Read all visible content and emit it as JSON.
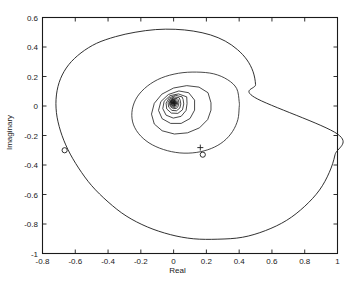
{
  "figure": {
    "xlabel": "Real",
    "ylabel": "Imaginary",
    "title": "",
    "line_color": "#1a1a1a",
    "axis_color": "#1a1a1a",
    "background": "#ffffff"
  },
  "axes": {
    "x_ticks": [
      "-0.8",
      "-0.6",
      "-0.4",
      "-0.2",
      "0",
      "0.2",
      "0.4",
      "0.6",
      "0.8",
      "1"
    ],
    "y_ticks": [
      "0.6",
      "0.4",
      "0.2",
      "0",
      "-0.2",
      "-0.4",
      "-0.6",
      "-0.8",
      "-1"
    ]
  },
  "chart_data": {
    "type": "line",
    "title": "",
    "xlabel": "Real",
    "ylabel": "Imaginary",
    "xlim": [
      -0.8,
      1.0
    ],
    "ylim": [
      -1.0,
      0.6
    ],
    "x_ticks": [
      -0.8,
      -0.6,
      -0.4,
      -0.2,
      0,
      0.2,
      0.4,
      0.6,
      0.8,
      1.0
    ],
    "y_ticks": [
      0.6,
      0.4,
      0.2,
      0,
      -0.2,
      -0.4,
      -0.6,
      -0.8,
      -1.0
    ],
    "grid": false,
    "legend": false,
    "series": [
      {
        "name": "outer-loop",
        "kind": "closed-polygon",
        "points": [
          [
            1.0,
            -0.19
          ],
          [
            0.985,
            -0.33
          ],
          [
            0.95,
            -0.45
          ],
          [
            0.89,
            -0.57
          ],
          [
            0.8,
            -0.68
          ],
          [
            0.69,
            -0.775
          ],
          [
            0.56,
            -0.845
          ],
          [
            0.42,
            -0.89
          ],
          [
            0.27,
            -0.903
          ],
          [
            0.12,
            -0.9
          ],
          [
            -0.02,
            -0.872
          ],
          [
            -0.16,
            -0.82
          ],
          [
            -0.29,
            -0.745
          ],
          [
            -0.4,
            -0.65
          ],
          [
            -0.5,
            -0.54
          ],
          [
            -0.58,
            -0.42
          ],
          [
            -0.645,
            -0.295
          ],
          [
            -0.69,
            -0.17
          ],
          [
            -0.715,
            -0.045
          ],
          [
            -0.715,
            0.075
          ],
          [
            -0.69,
            0.185
          ],
          [
            -0.64,
            0.28
          ],
          [
            -0.565,
            0.36
          ],
          [
            -0.47,
            0.425
          ],
          [
            -0.355,
            0.47
          ],
          [
            -0.235,
            0.5
          ],
          [
            -0.11,
            0.518
          ],
          [
            0.01,
            0.52
          ],
          [
            0.12,
            0.508
          ],
          [
            0.225,
            0.482
          ],
          [
            0.315,
            0.44
          ],
          [
            0.39,
            0.382
          ],
          [
            0.448,
            0.312
          ],
          [
            0.485,
            0.232
          ],
          [
            0.5,
            0.145
          ],
          [
            0.495,
            0.058
          ]
        ]
      },
      {
        "name": "ring-2",
        "kind": "closed-polygon",
        "points": [
          [
            0.4,
            0.03
          ],
          [
            0.385,
            0.118
          ],
          [
            0.33,
            0.178
          ],
          [
            0.245,
            0.218
          ],
          [
            0.14,
            0.23
          ],
          [
            0.03,
            0.222
          ],
          [
            -0.075,
            0.19
          ],
          [
            -0.16,
            0.135
          ],
          [
            -0.222,
            0.062
          ],
          [
            -0.252,
            -0.022
          ],
          [
            -0.25,
            -0.108
          ],
          [
            -0.215,
            -0.185
          ],
          [
            -0.15,
            -0.25
          ],
          [
            -0.062,
            -0.295
          ],
          [
            0.038,
            -0.318
          ],
          [
            0.138,
            -0.315
          ],
          [
            0.23,
            -0.288
          ],
          [
            0.305,
            -0.24
          ],
          [
            0.36,
            -0.172
          ],
          [
            0.392,
            -0.092
          ],
          [
            0.4,
            -0.01
          ]
        ]
      },
      {
        "name": "ring-3",
        "kind": "closed-polygon",
        "points": [
          [
            0.228,
            0.022
          ],
          [
            0.21,
            0.09
          ],
          [
            0.155,
            0.128
          ],
          [
            0.08,
            0.138
          ],
          [
            0.0,
            0.122
          ],
          [
            -0.072,
            0.08
          ],
          [
            -0.118,
            0.018
          ],
          [
            -0.135,
            -0.055
          ],
          [
            -0.118,
            -0.122
          ],
          [
            -0.07,
            -0.168
          ],
          [
            0.005,
            -0.19
          ],
          [
            0.085,
            -0.182
          ],
          [
            0.158,
            -0.148
          ],
          [
            0.208,
            -0.092
          ],
          [
            0.228,
            -0.028
          ]
        ]
      },
      {
        "name": "ring-4",
        "kind": "closed-polygon",
        "points": [
          [
            0.128,
            0.04
          ],
          [
            0.092,
            0.09
          ],
          [
            0.032,
            0.102
          ],
          [
            -0.032,
            0.078
          ],
          [
            -0.078,
            0.03
          ],
          [
            -0.092,
            -0.03
          ],
          [
            -0.07,
            -0.086
          ],
          [
            -0.018,
            -0.118
          ],
          [
            0.046,
            -0.118
          ],
          [
            0.1,
            -0.085
          ],
          [
            0.128,
            -0.028
          ]
        ]
      },
      {
        "name": "ring-5",
        "kind": "closed-polygon",
        "points": [
          [
            0.08,
            0.062
          ],
          [
            0.03,
            0.082
          ],
          [
            -0.022,
            0.07
          ],
          [
            -0.058,
            0.032
          ],
          [
            -0.066,
            -0.018
          ],
          [
            -0.046,
            -0.062
          ],
          [
            -0.002,
            -0.082
          ],
          [
            0.046,
            -0.07
          ],
          [
            0.076,
            -0.03
          ],
          [
            0.082,
            0.016
          ]
        ]
      },
      {
        "name": "ring-6",
        "kind": "closed-polygon",
        "points": [
          [
            0.052,
            0.062
          ],
          [
            0.012,
            0.072
          ],
          [
            -0.026,
            0.056
          ],
          [
            -0.046,
            0.02
          ],
          [
            -0.042,
            -0.02
          ],
          [
            -0.014,
            -0.048
          ],
          [
            0.026,
            -0.05
          ],
          [
            0.054,
            -0.026
          ],
          [
            0.062,
            0.014
          ],
          [
            0.058,
            0.044
          ]
        ]
      },
      {
        "name": "ring-7",
        "kind": "closed-polygon",
        "points": [
          [
            0.034,
            0.056
          ],
          [
            0.004,
            0.062
          ],
          [
            -0.022,
            0.048
          ],
          [
            -0.034,
            0.022
          ],
          [
            -0.03,
            -0.008
          ],
          [
            -0.01,
            -0.03
          ],
          [
            0.018,
            -0.032
          ],
          [
            0.038,
            -0.014
          ],
          [
            0.044,
            0.014
          ],
          [
            0.04,
            0.04
          ]
        ]
      },
      {
        "name": "ring-8",
        "kind": "closed-polygon",
        "points": [
          [
            0.022,
            0.05
          ],
          [
            -0.002,
            0.054
          ],
          [
            -0.02,
            0.04
          ],
          [
            -0.026,
            0.018
          ],
          [
            -0.02,
            -0.004
          ],
          [
            -0.002,
            -0.018
          ],
          [
            0.018,
            -0.016
          ],
          [
            0.03,
            0.002
          ],
          [
            0.032,
            0.026
          ],
          [
            0.028,
            0.042
          ]
        ]
      },
      {
        "name": "ring-9",
        "kind": "closed-polygon",
        "points": [
          [
            0.014,
            0.046
          ],
          [
            -0.004,
            0.048
          ],
          [
            -0.018,
            0.036
          ],
          [
            -0.022,
            0.018
          ],
          [
            -0.016,
            0.0
          ],
          [
            -0.002,
            -0.01
          ],
          [
            0.012,
            -0.008
          ],
          [
            0.022,
            0.006
          ],
          [
            0.024,
            0.024
          ],
          [
            0.02,
            0.038
          ]
        ]
      },
      {
        "name": "ring-10",
        "kind": "closed-polygon",
        "points": [
          [
            0.008,
            0.042
          ],
          [
            -0.006,
            0.044
          ],
          [
            -0.016,
            0.034
          ],
          [
            -0.018,
            0.019
          ],
          [
            -0.013,
            0.005
          ],
          [
            -0.002,
            -0.003
          ],
          [
            0.009,
            -0.001
          ],
          [
            0.016,
            0.01
          ],
          [
            0.018,
            0.024
          ],
          [
            0.014,
            0.036
          ]
        ]
      },
      {
        "name": "ring-11",
        "kind": "closed-polygon",
        "points": [
          [
            0.004,
            0.04
          ],
          [
            -0.007,
            0.041
          ],
          [
            -0.014,
            0.032
          ],
          [
            -0.016,
            0.02
          ],
          [
            -0.011,
            0.008
          ],
          [
            -0.002,
            0.001
          ],
          [
            0.007,
            0.003
          ],
          [
            0.013,
            0.012
          ],
          [
            0.014,
            0.024
          ],
          [
            0.011,
            0.034
          ]
        ]
      },
      {
        "name": "inner-dense-cluster",
        "kind": "closed-polygon",
        "points": [
          [
            0.001,
            0.038
          ],
          [
            -0.008,
            0.039
          ],
          [
            -0.013,
            0.031
          ],
          [
            -0.014,
            0.021
          ],
          [
            -0.01,
            0.011
          ],
          [
            -0.003,
            0.005
          ],
          [
            0.005,
            0.007
          ],
          [
            0.01,
            0.014
          ],
          [
            0.011,
            0.024
          ],
          [
            0.008,
            0.033
          ]
        ]
      }
    ],
    "markers": [
      {
        "name": "zero-marker-left",
        "symbol": "o",
        "x": -0.665,
        "y": -0.3
      },
      {
        "name": "zero-marker-right",
        "symbol": "o",
        "x": 0.178,
        "y": -0.33
      },
      {
        "name": "pole-marker-right",
        "symbol": "+",
        "x": 0.163,
        "y": -0.282
      },
      {
        "name": "pole-cluster-center",
        "symbol": "+",
        "x": 0.005,
        "y": 0.02
      }
    ]
  }
}
